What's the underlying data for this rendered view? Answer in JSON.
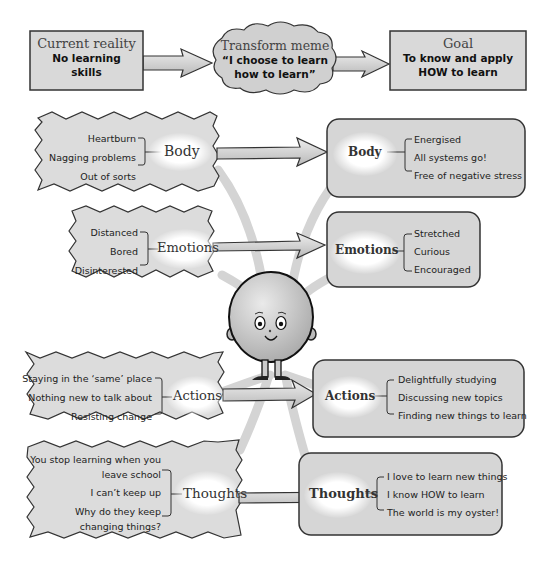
{
  "top_row": {
    "current": {
      "title": "Current reality",
      "line1": "No learning",
      "line2": "skills"
    },
    "meme": {
      "title": "Transform meme",
      "line1": "“I choose to learn",
      "line2": "how to learn”"
    },
    "goal": {
      "title": "Goal",
      "line1": "To know and apply",
      "line2": "HOW to learn"
    }
  },
  "before": [
    {
      "category": "Body",
      "items": [
        "Heartburn",
        "Nagging problems",
        "Out of sorts"
      ]
    },
    {
      "category": "Emotions",
      "items": [
        "Distanced",
        "Bored",
        "Disinterested"
      ]
    },
    {
      "category": "Actions",
      "items": [
        "Staying in the ‘same’ place",
        "Nothing new to talk about",
        "Resisting change"
      ]
    },
    {
      "category": "Thoughts",
      "items": [
        "You stop learning when you",
        "leave school",
        "I can’t keep up",
        "Why do they keep",
        "changing things?"
      ]
    }
  ],
  "after": [
    {
      "category": "Body",
      "items": [
        "Energised",
        "All systems go!",
        "Free of negative stress"
      ]
    },
    {
      "category": "Emotions",
      "items": [
        "Stretched",
        "Curious",
        "Encouraged"
      ]
    },
    {
      "category": "Actions",
      "items": [
        "Delightfully studying",
        "Discussing new topics",
        "Finding new things to learn"
      ]
    },
    {
      "category": "Thoughts",
      "items": [
        "I love to learn new things",
        "I know HOW to learn",
        "The world is my oyster!"
      ]
    }
  ],
  "character": {
    "icon": "smiling-round-character-icon"
  },
  "colors": {
    "box_fill": "#d6d6d6",
    "outline": "#333333",
    "arrow_fill": "#d0d0d0",
    "background": "#ffffff"
  }
}
